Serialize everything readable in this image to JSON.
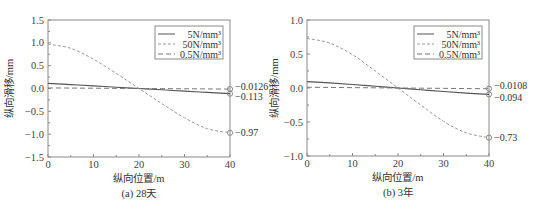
{
  "chart_data": [
    {
      "type": "line",
      "caption": "(a) 28天",
      "xlabel": "纵向位置/m",
      "ylabel": "纵向滑移/mm",
      "xlim": [
        0,
        40
      ],
      "ylim": [
        -1.5,
        1.5
      ],
      "xticks": [
        0,
        10,
        20,
        30,
        40
      ],
      "yticks": [
        -1.5,
        -1.0,
        -0.5,
        0.0,
        0.5,
        1.0,
        1.5
      ],
      "ytick_labels": [
        "−1.5",
        "−1.0",
        "−0.5",
        "0.0",
        "0.5",
        "1.0",
        "1.5"
      ],
      "grid": false,
      "legend_position": "upper right",
      "x": [
        0,
        5,
        10,
        15,
        20,
        25,
        30,
        35,
        40
      ],
      "series": [
        {
          "name": "5N/mm³",
          "style": "solid",
          "color": "#555555",
          "values": [
            0.113,
            0.085,
            0.057,
            0.028,
            0.0,
            -0.028,
            -0.057,
            -0.085,
            -0.113
          ]
        },
        {
          "name": "50N/mm³",
          "style": "dashed-light",
          "color": "#9a9a9a",
          "values": [
            0.97,
            0.88,
            0.64,
            0.33,
            0.0,
            -0.33,
            -0.64,
            -0.88,
            -0.97
          ]
        },
        {
          "name": "0.5N/mm³",
          "style": "dashed",
          "color": "#777777",
          "values": [
            0.0126,
            0.0095,
            0.0063,
            0.0032,
            0.0,
            -0.0032,
            -0.0063,
            -0.0095,
            -0.0126
          ]
        }
      ],
      "annotations": [
        {
          "x": 40,
          "y": -0.0126,
          "label": "−0.0126"
        },
        {
          "x": 40,
          "y": -0.113,
          "label": "−0.113"
        },
        {
          "x": 40,
          "y": -0.97,
          "label": "−0.97"
        }
      ]
    },
    {
      "type": "line",
      "caption": "(b) 3年",
      "xlabel": "纵向位置/m",
      "ylabel": "纵向滑移/mm",
      "xlim": [
        0,
        40
      ],
      "ylim": [
        -1.0,
        1.0
      ],
      "xticks": [
        0,
        10,
        20,
        30,
        40
      ],
      "yticks": [
        -1.0,
        -0.5,
        0.0,
        0.5,
        1.0
      ],
      "ytick_labels": [
        "−1.0",
        "−0.5",
        "0.0",
        "0.5",
        "1.0"
      ],
      "grid": false,
      "legend_position": "upper right",
      "x": [
        0,
        5,
        10,
        15,
        20,
        25,
        30,
        35,
        40
      ],
      "series": [
        {
          "name": "5N/mm³",
          "style": "solid",
          "color": "#555555",
          "values": [
            0.094,
            0.075,
            0.052,
            0.026,
            0.0,
            -0.026,
            -0.052,
            -0.075,
            -0.094
          ]
        },
        {
          "name": "50N/mm³",
          "style": "dashed-light",
          "color": "#9a9a9a",
          "values": [
            0.73,
            0.66,
            0.49,
            0.25,
            0.0,
            -0.25,
            -0.49,
            -0.66,
            -0.73
          ]
        },
        {
          "name": "0.5N/mm³",
          "style": "dashed",
          "color": "#777777",
          "values": [
            0.0108,
            0.0081,
            0.0054,
            0.0027,
            0.0,
            -0.0027,
            -0.0054,
            -0.0081,
            -0.0108
          ]
        }
      ],
      "annotations": [
        {
          "x": 40,
          "y": -0.0108,
          "label": "−0.0108"
        },
        {
          "x": 40,
          "y": -0.094,
          "label": "−0.094"
        },
        {
          "x": 40,
          "y": -0.73,
          "label": "−0.73"
        }
      ]
    }
  ],
  "layout": {
    "panels": [
      {
        "left": 48,
        "top": 20,
        "right": 230,
        "bottom": 157
      },
      {
        "left": 307,
        "top": 20,
        "right": 489,
        "bottom": 156
      }
    ]
  }
}
